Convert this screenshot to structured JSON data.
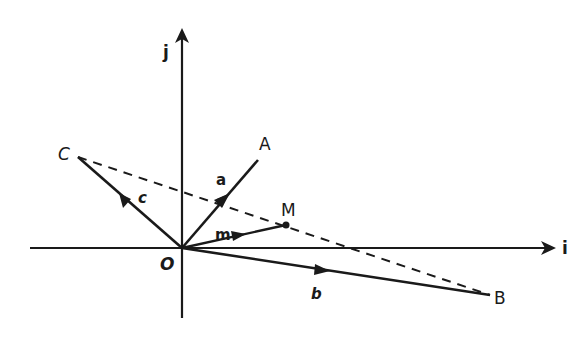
{
  "diagram": {
    "title": "",
    "colors": {
      "ink": "#1a1a1a",
      "background": "#ffffff"
    },
    "axes": {
      "i": {
        "label": "i"
      },
      "j": {
        "label": "j"
      }
    },
    "origin": {
      "label": "O"
    },
    "points": {
      "A": {
        "label": "A"
      },
      "B": {
        "label": "B"
      },
      "C": {
        "label": "C"
      },
      "M": {
        "label": "M"
      }
    },
    "vectors": {
      "a": {
        "label": "a",
        "from": "O",
        "to": "A"
      },
      "b": {
        "label": "b",
        "from": "O",
        "to": "B"
      },
      "c": {
        "label": "c",
        "from": "O",
        "to": "C"
      },
      "m": {
        "label": "m",
        "from": "O",
        "to": "M"
      }
    },
    "dashed_line": {
      "from": "C",
      "to": "B",
      "through": "M"
    }
  }
}
